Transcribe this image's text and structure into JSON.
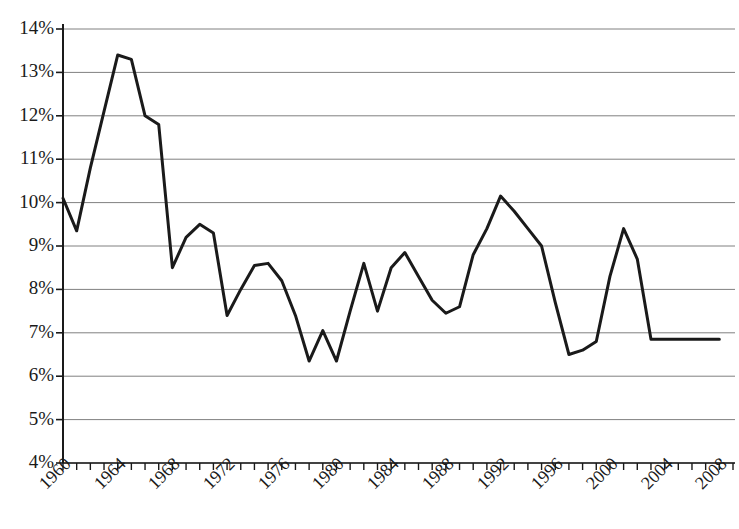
{
  "chart_data": {
    "type": "line",
    "title": "",
    "subtitle": "",
    "xlabel": "",
    "ylabel": "",
    "xlim": [
      1960,
      2009
    ],
    "ylim": [
      4,
      14
    ],
    "y_tick_step": 1,
    "x_tick_step": 1,
    "x_label_step": 4,
    "grid": "horizontal",
    "legend": "none",
    "y_tick_labels": [
      "14%",
      "13%",
      "12%",
      "11%",
      "10%",
      "9%",
      "8%",
      "7%",
      "6%",
      "5%",
      "4%"
    ],
    "y_ticks": [
      14,
      13,
      12,
      11,
      10,
      9,
      8,
      7,
      6,
      5,
      4
    ],
    "x_tick_labels": [
      "1960",
      "1964",
      "1968",
      "1972",
      "1976",
      "1980",
      "1984",
      "1988",
      "1992",
      "1996",
      "2000",
      "2004",
      "2008"
    ],
    "x_ticks_labeled": [
      1960,
      1964,
      1968,
      1972,
      1976,
      1980,
      1984,
      1988,
      1992,
      1996,
      2000,
      2004,
      2008
    ],
    "series": [
      {
        "name": "series-1",
        "color": "#1a1a1a",
        "line_width": 3,
        "x": [
          1960,
          1961,
          1962,
          1963,
          1964,
          1965,
          1966,
          1967,
          1968,
          1969,
          1970,
          1971,
          1972,
          1973,
          1974,
          1975,
          1976,
          1977,
          1978,
          1979,
          1980,
          1981,
          1982,
          1983,
          1984,
          1985,
          1986,
          1987,
          1988,
          1989,
          1990,
          1991,
          1992,
          1993,
          1994,
          1995,
          1996,
          1997,
          1998,
          1999,
          2000,
          2001,
          2002,
          2003,
          2004,
          2005,
          2006,
          2007,
          2008
        ],
        "values": [
          10.1,
          9.35,
          10.8,
          12.1,
          13.4,
          13.3,
          12.0,
          11.8,
          8.5,
          9.2,
          9.5,
          9.3,
          7.4,
          8.0,
          8.55,
          8.6,
          8.2,
          7.4,
          6.35,
          7.05,
          6.35,
          7.5,
          8.6,
          7.5,
          8.5,
          8.85,
          8.3,
          7.75,
          7.45,
          7.6,
          8.8,
          9.4,
          10.15,
          9.8,
          9.4,
          9.0,
          7.7,
          6.5,
          6.6,
          6.8,
          8.3,
          9.4,
          8.7,
          6.85,
          6.85,
          6.85,
          6.85,
          6.85,
          6.85
        ]
      }
    ],
    "colors": {
      "line": "#1a1a1a",
      "grid": "#808080",
      "axis": "#1a1a1a",
      "background": "#ffffff",
      "text": "#1a1a1a"
    }
  },
  "geometry": {
    "plot_left": 63,
    "plot_right": 733,
    "plot_top": 29,
    "plot_bottom": 463
  }
}
